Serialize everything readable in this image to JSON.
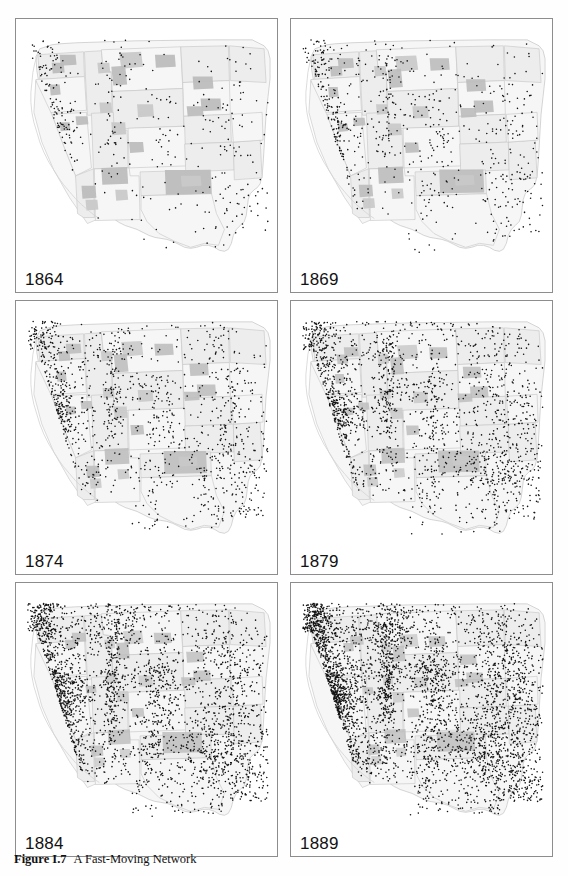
{
  "figure": {
    "caption_number": "Figure I.7",
    "caption_title": "A Fast-Moving Network",
    "region": "Western United States",
    "panel_count": 6,
    "columns": 2,
    "rows": 3
  },
  "colors": {
    "page_background": "#fefefe",
    "panel_background": "#ffffff",
    "panel_border": "#8d8d8d",
    "state_fill_light": "#ededed",
    "state_fill_pale": "#f6f6f6",
    "reservation_fill": "#c9c9c9",
    "reservation_fill_dark": "#bdbdbd",
    "state_border": "#c4c4c4",
    "coast_outline": "#d3d3d3",
    "dot_color": "#141414",
    "label_color": "#121212",
    "caption_color": "#111111"
  },
  "panels": [
    {
      "id": "panel-1864",
      "year": "1864",
      "row": 1,
      "col": 1,
      "density": 0.1,
      "seed": 1864
    },
    {
      "id": "panel-1869",
      "year": "1869",
      "row": 1,
      "col": 2,
      "density": 0.18,
      "seed": 1869
    },
    {
      "id": "panel-1874",
      "year": "1874",
      "row": 2,
      "col": 1,
      "density": 0.31,
      "seed": 1874
    },
    {
      "id": "panel-1879",
      "year": "1879",
      "row": 2,
      "col": 2,
      "density": 0.46,
      "seed": 1879
    },
    {
      "id": "panel-1884",
      "year": "1884",
      "row": 3,
      "col": 1,
      "density": 0.7,
      "seed": 1884
    },
    {
      "id": "panel-1889",
      "year": "1889",
      "row": 3,
      "col": 2,
      "density": 1.0,
      "seed": 1889
    }
  ],
  "chart_data": {
    "type": "scatter",
    "title": "A Fast-Moving Network",
    "subtitle": "",
    "xlabel": "",
    "ylabel": "",
    "legend": [],
    "grid": false,
    "small_multiples": true,
    "facet_variable": "year",
    "facet_values": [
      "1864",
      "1869",
      "1874",
      "1879",
      "1884",
      "1889"
    ],
    "point_marker": "filled-circle",
    "point_size_px": 1.6,
    "basemap": "western-united-states-states-and-territories",
    "series": [
      {
        "name": "1864",
        "relative_point_count": 10
      },
      {
        "name": "1869",
        "relative_point_count": 18
      },
      {
        "name": "1874",
        "relative_point_count": 31
      },
      {
        "name": "1879",
        "relative_point_count": 46
      },
      {
        "name": "1884",
        "relative_point_count": 70
      },
      {
        "name": "1889",
        "relative_point_count": 100
      }
    ],
    "clusters": [
      {
        "name": "puget-sound",
        "cx": 0.115,
        "cy": 0.105,
        "rx": 0.035,
        "ry": 0.085,
        "weight": 1.5,
        "onset": 0
      },
      {
        "name": "willamette-valley",
        "cx": 0.085,
        "cy": 0.205,
        "rx": 0.03,
        "ry": 0.075,
        "weight": 1.7,
        "onset": 0
      },
      {
        "name": "san-francisco-bay",
        "cx": 0.105,
        "cy": 0.43,
        "rx": 0.055,
        "ry": 0.06,
        "weight": 2.4,
        "onset": 0
      },
      {
        "name": "sierra-foothills",
        "cx": 0.155,
        "cy": 0.395,
        "rx": 0.04,
        "ry": 0.075,
        "weight": 1.8,
        "onset": 0
      },
      {
        "name": "central-valley-south",
        "cx": 0.15,
        "cy": 0.56,
        "rx": 0.035,
        "ry": 0.08,
        "weight": 1.0,
        "onset": 0
      },
      {
        "name": "southern-california",
        "cx": 0.185,
        "cy": 0.65,
        "rx": 0.035,
        "ry": 0.045,
        "weight": 0.8,
        "onset": 1
      },
      {
        "name": "wasatch-front",
        "cx": 0.37,
        "cy": 0.39,
        "rx": 0.02,
        "ry": 0.11,
        "weight": 2.0,
        "onset": 0
      },
      {
        "name": "idaho-montana-mines",
        "cx": 0.37,
        "cy": 0.165,
        "rx": 0.045,
        "ry": 0.055,
        "weight": 1.4,
        "onset": 0
      },
      {
        "name": "colorado-front-range",
        "cx": 0.555,
        "cy": 0.425,
        "rx": 0.035,
        "ry": 0.12,
        "weight": 1.9,
        "onset": 0
      },
      {
        "name": "eastern-kansas-nebraska",
        "cx": 0.83,
        "cy": 0.385,
        "rx": 0.075,
        "ry": 0.13,
        "weight": 3.0,
        "onset": 0
      },
      {
        "name": "eastern-texas",
        "cx": 0.835,
        "cy": 0.69,
        "rx": 0.08,
        "ry": 0.11,
        "weight": 3.0,
        "onset": 0
      },
      {
        "name": "dakota-red-river",
        "cx": 0.76,
        "cy": 0.18,
        "rx": 0.055,
        "ry": 0.09,
        "weight": 0.9,
        "onset": 2
      },
      {
        "name": "indian-territory",
        "cx": 0.745,
        "cy": 0.585,
        "rx": 0.06,
        "ry": 0.05,
        "weight": 1.1,
        "onset": 2
      },
      {
        "name": "new-mexico-rio-grande",
        "cx": 0.52,
        "cy": 0.64,
        "rx": 0.03,
        "ry": 0.09,
        "weight": 0.9,
        "onset": 1
      },
      {
        "name": "arizona-territory",
        "cx": 0.33,
        "cy": 0.64,
        "rx": 0.055,
        "ry": 0.06,
        "weight": 0.7,
        "onset": 2
      },
      {
        "name": "nevada-comstock",
        "cx": 0.255,
        "cy": 0.4,
        "rx": 0.04,
        "ry": 0.08,
        "weight": 0.9,
        "onset": 1
      },
      {
        "name": "wyoming-rail",
        "cx": 0.48,
        "cy": 0.33,
        "rx": 0.09,
        "ry": 0.03,
        "weight": 1.0,
        "onset": 1
      },
      {
        "name": "montana-north",
        "cx": 0.47,
        "cy": 0.12,
        "rx": 0.09,
        "ry": 0.045,
        "weight": 0.8,
        "onset": 3
      },
      {
        "name": "west-texas-panhandle",
        "cx": 0.68,
        "cy": 0.62,
        "rx": 0.06,
        "ry": 0.07,
        "weight": 0.9,
        "onset": 3
      },
      {
        "name": "oregon-interior",
        "cx": 0.2,
        "cy": 0.19,
        "rx": 0.06,
        "ry": 0.06,
        "weight": 0.8,
        "onset": 1
      }
    ]
  }
}
